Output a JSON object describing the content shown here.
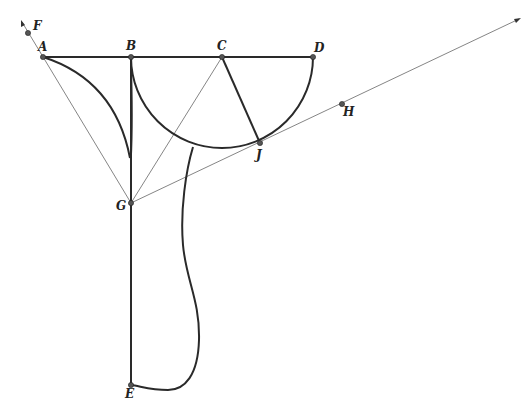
{
  "diagram": {
    "points": {
      "A": {
        "label": "A",
        "x": 43,
        "y": 57
      },
      "B": {
        "label": "B",
        "x": 131,
        "y": 57
      },
      "C": {
        "label": "C",
        "x": 222,
        "y": 57
      },
      "D": {
        "label": "D",
        "x": 313,
        "y": 57
      },
      "E": {
        "label": "E",
        "x": 131,
        "y": 385
      },
      "F": {
        "label": "F",
        "x": 28,
        "y": 33
      },
      "G": {
        "label": "G",
        "x": 131,
        "y": 203
      },
      "H": {
        "label": "H",
        "x": 342,
        "y": 104
      },
      "J": {
        "label": "J",
        "x": 260,
        "y": 143
      }
    },
    "colors": {
      "thick": "#2a2a2a",
      "thin": "#666666",
      "point": "#555555"
    }
  }
}
